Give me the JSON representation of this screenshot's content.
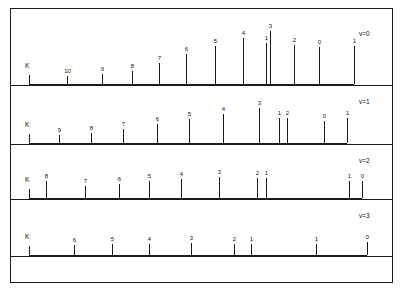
{
  "figure": {
    "title": "",
    "axis_series_label": "K",
    "rows": [
      {
        "v_label": "v=0",
        "k_marker": "K",
        "lines": [
          {
            "label": "10",
            "x": 38,
            "h": 8
          },
          {
            "label": "9",
            "x": 73,
            "h": 10
          },
          {
            "label": "8",
            "x": 103,
            "h": 13
          },
          {
            "label": "7",
            "x": 130,
            "h": 21
          },
          {
            "label": "6",
            "x": 157,
            "h": 30
          },
          {
            "label": "5",
            "x": 186,
            "h": 38
          },
          {
            "label": "4",
            "x": 214,
            "h": 46
          },
          {
            "label": "1",
            "x": 237,
            "h": 41
          },
          {
            "label": "3",
            "x": 241,
            "h": 53
          },
          {
            "label": "2",
            "x": 265,
            "h": 39
          },
          {
            "label": "0",
            "x": 290,
            "h": 37
          },
          {
            "label": "1",
            "x": 325,
            "h": 38
          }
        ]
      },
      {
        "v_label": "v=1",
        "k_marker": "K",
        "lines": [
          {
            "label": "9",
            "x": 30,
            "h": 8
          },
          {
            "label": "8",
            "x": 62,
            "h": 10
          },
          {
            "label": "7",
            "x": 94,
            "h": 14
          },
          {
            "label": "6",
            "x": 128,
            "h": 19
          },
          {
            "label": "5",
            "x": 160,
            "h": 24
          },
          {
            "label": "4",
            "x": 194,
            "h": 29
          },
          {
            "label": "3",
            "x": 230,
            "h": 35
          },
          {
            "label": "1",
            "x": 250,
            "h": 25
          },
          {
            "label": "2",
            "x": 258,
            "h": 25
          },
          {
            "label": "0",
            "x": 295,
            "h": 22
          },
          {
            "label": "1",
            "x": 318,
            "h": 25
          }
        ]
      },
      {
        "v_label": "v=2",
        "k_marker": "K",
        "lines": [
          {
            "label": "8",
            "x": 17,
            "h": 17
          },
          {
            "label": "7",
            "x": 56,
            "h": 12
          },
          {
            "label": "6",
            "x": 90,
            "h": 14
          },
          {
            "label": "5",
            "x": 120,
            "h": 17
          },
          {
            "label": "4",
            "x": 152,
            "h": 19
          },
          {
            "label": "3",
            "x": 190,
            "h": 21
          },
          {
            "label": "2",
            "x": 228,
            "h": 20
          },
          {
            "label": "1",
            "x": 237,
            "h": 20
          },
          {
            "label": "1",
            "x": 320,
            "h": 17
          },
          {
            "label": "0",
            "x": 333,
            "h": 17
          }
        ]
      },
      {
        "v_label": "v=3",
        "k_marker": "K",
        "lines": [
          {
            "label": "6",
            "x": 45,
            "h": 10
          },
          {
            "label": "5",
            "x": 83,
            "h": 11
          },
          {
            "label": "4",
            "x": 120,
            "h": 11
          },
          {
            "label": "3",
            "x": 162,
            "h": 12
          },
          {
            "label": "2",
            "x": 205,
            "h": 11
          },
          {
            "label": "1",
            "x": 222,
            "h": 11
          },
          {
            "label": "1",
            "x": 287,
            "h": 11
          },
          {
            "label": "0",
            "x": 338,
            "h": 13
          }
        ]
      }
    ]
  },
  "chart_data": {
    "type": "bar",
    "xlabel": "",
    "ylabel": "Relative intensity",
    "grid": false,
    "legend": "none",
    "note": "Stick (line) spectrum; each stick is labelled with its K quantum number. Four panels for v=0,1,2,3. 'K' marks the quantum-number label series at the left of each panel. x positions are relative pixel offsets within each panel; heights are relative intensities.",
    "series": [
      {
        "name": "v=0",
        "categories": [
          "10",
          "9",
          "8",
          "7",
          "6",
          "5",
          "4",
          "1",
          "3",
          "2",
          "0",
          "1"
        ],
        "x": [
          38,
          73,
          103,
          130,
          157,
          186,
          214,
          237,
          241,
          265,
          290,
          325
        ],
        "values": [
          8,
          10,
          13,
          21,
          30,
          38,
          46,
          41,
          53,
          39,
          37,
          38
        ]
      },
      {
        "name": "v=1",
        "categories": [
          "9",
          "8",
          "7",
          "6",
          "5",
          "4",
          "3",
          "1",
          "2",
          "0",
          "1"
        ],
        "x": [
          30,
          62,
          94,
          128,
          160,
          194,
          230,
          250,
          258,
          295,
          318
        ],
        "values": [
          8,
          10,
          14,
          19,
          24,
          29,
          35,
          25,
          25,
          22,
          25
        ]
      },
      {
        "name": "v=2",
        "categories": [
          "8",
          "7",
          "6",
          "5",
          "4",
          "3",
          "2",
          "1",
          "1",
          "0"
        ],
        "x": [
          17,
          56,
          90,
          120,
          152,
          190,
          228,
          237,
          320,
          333
        ],
        "values": [
          17,
          12,
          14,
          17,
          19,
          21,
          20,
          20,
          17,
          17
        ]
      },
      {
        "name": "v=3",
        "categories": [
          "6",
          "5",
          "4",
          "3",
          "2",
          "1",
          "1",
          "0"
        ],
        "x": [
          45,
          83,
          120,
          162,
          205,
          222,
          287,
          338
        ],
        "values": [
          10,
          11,
          11,
          12,
          11,
          11,
          11,
          13
        ]
      }
    ]
  }
}
